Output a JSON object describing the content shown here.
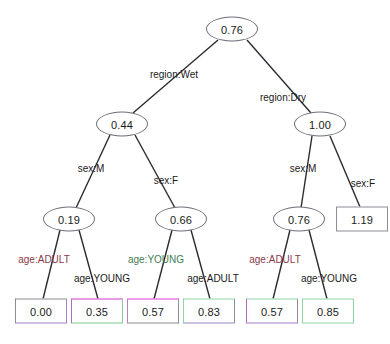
{
  "diagram": {
    "type": "decision-tree",
    "title": "",
    "nodes": [
      {
        "id": "root",
        "label": "0.76",
        "shape": "ellipse",
        "x": 232,
        "y": 29
      },
      {
        "id": "wet",
        "label": "0.44",
        "shape": "ellipse",
        "x": 122,
        "y": 124
      },
      {
        "id": "dry",
        "label": "1.00",
        "shape": "ellipse",
        "x": 320,
        "y": 124
      },
      {
        "id": "wet-m",
        "label": "0.19",
        "shape": "ellipse",
        "x": 69,
        "y": 219
      },
      {
        "id": "wet-f",
        "label": "0.66",
        "shape": "ellipse",
        "x": 181,
        "y": 219
      },
      {
        "id": "dry-m",
        "label": "0.76",
        "shape": "ellipse",
        "x": 299,
        "y": 219
      },
      {
        "id": "dry-f",
        "label": "1.19",
        "shape": "rect",
        "x": 362,
        "y": 219,
        "border_top": "#8d8d96",
        "border_right": "#8d8d96",
        "border_bottom": "#8d8d96",
        "border_left": "#8d8d96"
      }
    ],
    "leaves": [
      {
        "id": "leaf-1",
        "label": "0.00",
        "x": 41,
        "y": 311,
        "border_top": "#8d8d96",
        "border_right": "#9a86c4",
        "border_bottom": "#a47fd0",
        "border_left": "#8d8d96"
      },
      {
        "id": "leaf-2",
        "label": "0.35",
        "x": 97,
        "y": 311,
        "border_top": "#d23ad2",
        "border_right": "#8fcb9b",
        "border_bottom": "#77c98d",
        "border_left": "#b06ab8"
      },
      {
        "id": "leaf-3",
        "label": "0.57",
        "x": 153,
        "y": 311,
        "border_top": "#e23ce2",
        "border_right": "#8d8d96",
        "border_bottom": "#8d8d96",
        "border_left": "#b77fbe"
      },
      {
        "id": "leaf-4",
        "label": "0.83",
        "x": 209,
        "y": 311,
        "border_top": "#8fd4a0",
        "border_right": "#8d8d96",
        "border_bottom": "#9a86c4",
        "border_left": "#8fd4a0"
      },
      {
        "id": "leaf-5",
        "label": "0.57",
        "x": 272,
        "y": 311,
        "border_top": "#8fd4a0",
        "border_right": "#8d8d96",
        "border_bottom": "#a47fd0",
        "border_left": "#b06ab8"
      },
      {
        "id": "leaf-6",
        "label": "0.85",
        "x": 328,
        "y": 311,
        "border_top": "#8fd4a0",
        "border_right": "#8fd4a0",
        "border_bottom": "#8fd4a0",
        "border_left": "#8fd4a0"
      }
    ],
    "edge_labels": [
      {
        "id": "lbl-region-wet",
        "text": "region:Wet",
        "x": 174,
        "y": 74,
        "color": "#1a1a1a"
      },
      {
        "id": "lbl-region-dry",
        "text": "region:Dry",
        "x": 283,
        "y": 97,
        "color": "#1a1a1a"
      },
      {
        "id": "lbl-wet-sex-m",
        "text": "sex:M",
        "x": 91,
        "y": 168,
        "color": "#1a1a1a"
      },
      {
        "id": "lbl-wet-sex-f",
        "text": "sex:F",
        "x": 166,
        "y": 180,
        "color": "#1a1a1a"
      },
      {
        "id": "lbl-dry-sex-m",
        "text": "sex:M",
        "x": 303,
        "y": 168,
        "color": "#1a1a1a"
      },
      {
        "id": "lbl-dry-sex-f",
        "text": "sex:F",
        "x": 363,
        "y": 183,
        "color": "#1a1a1a"
      },
      {
        "id": "lbl-a1",
        "text": "age:ADULT",
        "x": 44,
        "y": 259,
        "color": "#8b3a4a"
      },
      {
        "id": "lbl-a2",
        "text": "age:YOUNG",
        "x": 102,
        "y": 278,
        "color": "#1a1a1a"
      },
      {
        "id": "lbl-a3",
        "text": "age:YOUNG",
        "x": 156,
        "y": 259,
        "color": "#3f7d52"
      },
      {
        "id": "lbl-a4",
        "text": "age:ADULT",
        "x": 213,
        "y": 278,
        "color": "#1a1a1a"
      },
      {
        "id": "lbl-a5",
        "text": "age:ADULT",
        "x": 275,
        "y": 259,
        "color": "#8b3a4a"
      },
      {
        "id": "lbl-a6",
        "text": "age:YOUNG",
        "x": 329,
        "y": 278,
        "color": "#1a1a1a"
      }
    ],
    "edges": [
      {
        "id": "e-root-wet",
        "x1": 218,
        "y1": 40,
        "x2": 133,
        "y2": 113
      },
      {
        "id": "e-root-dry",
        "x1": 247,
        "y1": 40,
        "x2": 311,
        "y2": 113
      },
      {
        "id": "e-wet-m",
        "x1": 110,
        "y1": 135,
        "x2": 76,
        "y2": 208
      },
      {
        "id": "e-wet-f",
        "x1": 135,
        "y1": 135,
        "x2": 175,
        "y2": 208
      },
      {
        "id": "e-dry-m",
        "x1": 312,
        "y1": 136,
        "x2": 301,
        "y2": 208
      },
      {
        "id": "e-dry-f",
        "x1": 330,
        "y1": 136,
        "x2": 360,
        "y2": 207
      },
      {
        "id": "e-l1",
        "x1": 60,
        "y1": 230,
        "x2": 43,
        "y2": 299
      },
      {
        "id": "e-l2",
        "x1": 79,
        "y1": 230,
        "x2": 98,
        "y2": 299
      },
      {
        "id": "e-l3",
        "x1": 172,
        "y1": 230,
        "x2": 154,
        "y2": 299
      },
      {
        "id": "e-l4",
        "x1": 191,
        "y1": 230,
        "x2": 210,
        "y2": 299
      },
      {
        "id": "e-l5",
        "x1": 290,
        "y1": 230,
        "x2": 273,
        "y2": 299
      },
      {
        "id": "e-l6",
        "x1": 309,
        "y1": 230,
        "x2": 327,
        "y2": 299
      }
    ]
  },
  "chart_data": {
    "type": "tree",
    "title": "",
    "root": {
      "value": "0.76",
      "children": [
        {
          "edge": "region:Wet",
          "value": "0.44",
          "children": [
            {
              "edge": "sex:M",
              "value": "0.19",
              "children": [
                {
                  "edge": "age:ADULT",
                  "value": "0.00"
                },
                {
                  "edge": "age:YOUNG",
                  "value": "0.35"
                }
              ]
            },
            {
              "edge": "sex:F",
              "value": "0.66",
              "children": [
                {
                  "edge": "age:YOUNG",
                  "value": "0.57"
                },
                {
                  "edge": "age:ADULT",
                  "value": "0.83"
                }
              ]
            }
          ]
        },
        {
          "edge": "region:Dry",
          "value": "1.00",
          "children": [
            {
              "edge": "sex:M",
              "value": "0.76",
              "children": [
                {
                  "edge": "age:ADULT",
                  "value": "0.57"
                },
                {
                  "edge": "age:YOUNG",
                  "value": "0.85"
                }
              ]
            },
            {
              "edge": "sex:F",
              "value": "1.19"
            }
          ]
        }
      ]
    },
    "split_variables": [
      "region",
      "sex",
      "age"
    ],
    "leaf_values": [
      "0.00",
      "0.35",
      "0.57",
      "0.83",
      "0.57",
      "0.85"
    ],
    "internal_values": [
      "0.76",
      "0.44",
      "1.00",
      "0.19",
      "0.66",
      "0.76"
    ]
  }
}
